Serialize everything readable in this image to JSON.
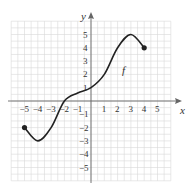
{
  "chart_data": {
    "type": "line",
    "title": "",
    "xlabel": "x",
    "ylabel": "y",
    "function_label": "f",
    "xlim": [
      -6,
      6
    ],
    "ylim": [
      -6,
      6
    ],
    "grid": true,
    "x_ticks": [
      "-5",
      "-4",
      "-3",
      "-2",
      "-1",
      "1",
      "2",
      "3",
      "4",
      "5"
    ],
    "y_ticks": [
      "5",
      "4",
      "3",
      "2",
      "1",
      "-1",
      "-2",
      "-3",
      "-4",
      "-5"
    ],
    "series": [
      {
        "name": "f",
        "x": [
          -5,
          -4,
          -3,
          -2,
          -1,
          0,
          1,
          2,
          3,
          4
        ],
        "y": [
          -2,
          -3,
          -2,
          0,
          0.6,
          1,
          2,
          4,
          5,
          4
        ]
      }
    ],
    "endpoints": [
      {
        "x": -5,
        "y": -2,
        "style": "filled"
      },
      {
        "x": 4,
        "y": 4,
        "style": "filled"
      }
    ],
    "extrema": {
      "min": {
        "x": -4,
        "y": -3
      },
      "max": {
        "x": 3,
        "y": 5
      }
    }
  }
}
